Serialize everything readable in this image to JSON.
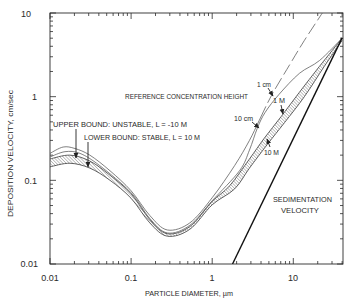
{
  "chart_data": {
    "type": "line",
    "title": "",
    "xlabel": "PARTICLE DIAMETER, µm",
    "ylabel": "DEPOSITION VELOCITY, cm/sec",
    "xscale": "log",
    "yscale": "log",
    "xlim": [
      0.01,
      41
    ],
    "ylim": [
      0.01,
      10
    ],
    "grid": false,
    "legend": "none (inline annotations)",
    "x_ticks": [
      "0.01",
      "0.1",
      "1",
      "10"
    ],
    "x_tick_values": [
      0.01,
      0.1,
      1,
      10
    ],
    "y_ticks": [
      "10",
      "1",
      "0.1",
      "0.01"
    ],
    "y_tick_values": [
      10,
      1,
      0.1,
      0.01
    ],
    "series": [
      {
        "name": "1 cm",
        "group": "reference concentration height",
        "points": [
          [
            0.01,
            0.21
          ],
          [
            0.0145,
            0.25
          ],
          [
            0.0203,
            0.24
          ],
          [
            0.031,
            0.2
          ],
          [
            0.055,
            0.13
          ],
          [
            0.1,
            0.075
          ],
          [
            0.17,
            0.038
          ],
          [
            0.28,
            0.0255
          ],
          [
            0.53,
            0.031
          ],
          [
            1.0,
            0.062
          ],
          [
            1.89,
            0.15
          ],
          [
            2.88,
            0.3
          ],
          [
            3.8,
            0.52
          ],
          [
            5.4,
            1.04
          ],
          [
            9.0,
            2.4
          ],
          [
            13.7,
            4.7
          ],
          [
            22.8,
            10
          ]
        ]
      },
      {
        "name": "10 cm",
        "group": "reference concentration height",
        "points": [
          [
            0.01,
            0.19
          ],
          [
            0.0153,
            0.22
          ],
          [
            0.0234,
            0.21
          ],
          [
            0.041,
            0.15
          ],
          [
            0.1,
            0.071
          ],
          [
            0.17,
            0.035
          ],
          [
            0.28,
            0.0235
          ],
          [
            0.53,
            0.029
          ],
          [
            1.0,
            0.057
          ],
          [
            2.17,
            0.13
          ],
          [
            2.88,
            0.23
          ],
          [
            3.6,
            0.42
          ],
          [
            4.5,
            0.65
          ],
          [
            6.7,
            1.07
          ],
          [
            11.9,
            1.9
          ],
          [
            21,
            2.7
          ],
          [
            40,
            5.0
          ]
        ]
      },
      {
        "name": "1 M",
        "group": "reference concentration height (upper edge of hatched band; upper bound: unstable, L = -10 M)",
        "points": [
          [
            0.01,
            0.18
          ],
          [
            0.0176,
            0.2
          ],
          [
            0.031,
            0.17
          ],
          [
            0.055,
            0.115
          ],
          [
            0.1,
            0.069
          ],
          [
            0.17,
            0.034
          ],
          [
            0.28,
            0.023
          ],
          [
            0.53,
            0.028
          ],
          [
            1.0,
            0.056
          ],
          [
            1.64,
            0.086
          ],
          [
            2.88,
            0.18
          ],
          [
            4.4,
            0.32
          ],
          [
            7.1,
            0.58
          ],
          [
            11.9,
            1.13
          ],
          [
            21,
            2.3
          ],
          [
            40,
            5.0
          ]
        ]
      },
      {
        "name": "10 M",
        "group": "reference concentration height (lower edge of hatched band; lower bound: stable, L = 10 M)",
        "points": [
          [
            0.01,
            0.145
          ],
          [
            0.0176,
            0.16
          ],
          [
            0.031,
            0.14
          ],
          [
            0.055,
            0.1
          ],
          [
            0.1,
            0.061
          ],
          [
            0.17,
            0.031
          ],
          [
            0.28,
            0.0215
          ],
          [
            0.53,
            0.026
          ],
          [
            1.0,
            0.051
          ],
          [
            1.89,
            0.079
          ],
          [
            2.88,
            0.14
          ],
          [
            4.8,
            0.27
          ],
          [
            7.8,
            0.49
          ],
          [
            13.7,
            1.0
          ],
          [
            24.1,
            2.3
          ],
          [
            40,
            4.7
          ]
        ]
      },
      {
        "name": "Sedimentation velocity",
        "group": "sedimentation",
        "points": [
          [
            1.78,
            0.01
          ],
          [
            40,
            5.05
          ]
        ]
      }
    ],
    "shaded_band": {
      "between": [
        "1 M",
        "10 M"
      ],
      "pattern": "hatched"
    },
    "annotations": {
      "reference_height": "REFERENCE CONCENTRATION HEIGHT",
      "upper_bound": "UPPER BOUND:  UNSTABLE, L = -10 M",
      "lower_bound": "LOWER BOUND:  STABLE, L = 10 M",
      "label_1cm": "1 cm",
      "label_10cm": "10 cm",
      "label_1M": "1 M",
      "label_10M": "10 M",
      "sedimentation_line1": "SEDIMENTATION",
      "sedimentation_line2": "VELOCITY"
    },
    "colors": {
      "axes": "#2a2a2a",
      "curves": "#555555",
      "sedimentation": "#111111",
      "hatch": "#555555"
    }
  }
}
